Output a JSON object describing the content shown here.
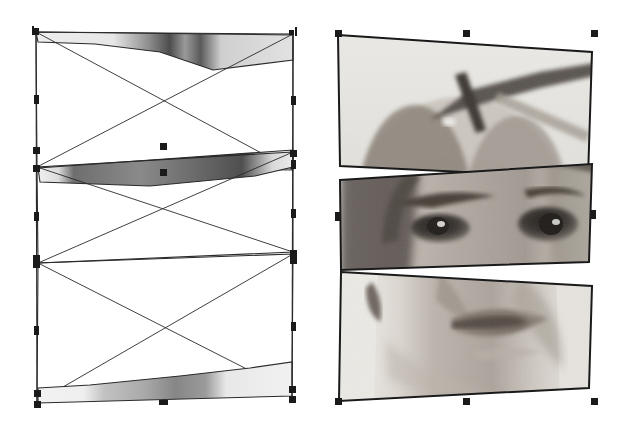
{
  "document": {
    "title": "Sliced portrait composition",
    "canvas_width": 629,
    "canvas_height": 435,
    "background_color": "#ffffff",
    "view_mode_left": "wireframe",
    "view_mode_right": "preview"
  },
  "panels": [
    {
      "id": "wireframe-panel",
      "label": "Wireframe view",
      "x": 0,
      "y": 0,
      "width": 314,
      "height": 435,
      "stroke_color": "#1a1a1a",
      "selection_handle_color": "#1a1a1a"
    },
    {
      "id": "preview-panel",
      "label": "Rendered preview",
      "x": 315,
      "y": 0,
      "width": 314,
      "height": 435,
      "stroke_color": "#1a1a1a",
      "selection_handle_color": "#1a1a1a"
    }
  ],
  "slices": [
    {
      "index": 0,
      "name": "slice-top-hat",
      "description": "Top band: hat brim and upper head",
      "bbox_wire": {
        "x": 35,
        "y": 31,
        "width": 258,
        "height": 140
      },
      "bbox_preview": {
        "x": 337,
        "y": 33,
        "width": 257,
        "height": 145
      },
      "quad_wire": [
        [
          35,
          31
        ],
        [
          293,
          33
        ],
        [
          293,
          171
        ],
        [
          37,
          169
        ]
      ],
      "quad_preview": [
        [
          338,
          35
        ],
        [
          592,
          52
        ],
        [
          588,
          178
        ],
        [
          340,
          166
        ]
      ],
      "skew_degrees": 3.8,
      "fill_tone": "#d8d8d8"
    },
    {
      "index": 1,
      "name": "slice-middle-eyes",
      "description": "Middle band: brow and eyes",
      "bbox_wire": {
        "x": 35,
        "y": 168,
        "width": 258,
        "height": 95
      },
      "bbox_preview": {
        "x": 337,
        "y": 170,
        "width": 257,
        "height": 95
      },
      "quad_wire": [
        [
          37,
          169
        ],
        [
          293,
          161
        ],
        [
          293,
          257
        ],
        [
          37,
          263
        ]
      ],
      "quad_preview": [
        [
          340,
          180
        ],
        [
          592,
          164
        ],
        [
          589,
          262
        ],
        [
          341,
          270
        ]
      ],
      "skew_degrees": -3.6,
      "fill_tone": "#9a9a9a"
    },
    {
      "index": 2,
      "name": "slice-bottom-mouth",
      "description": "Bottom band: nose, lips and chin",
      "bbox_wire": {
        "x": 35,
        "y": 256,
        "width": 258,
        "height": 148
      },
      "bbox_preview": {
        "x": 337,
        "y": 258,
        "width": 257,
        "height": 145
      },
      "quad_wire": [
        [
          37,
          263
        ],
        [
          293,
          257
        ],
        [
          293,
          396
        ],
        [
          35,
          404
        ]
      ],
      "quad_preview": [
        [
          341,
          272
        ],
        [
          592,
          286
        ],
        [
          589,
          388
        ],
        [
          339,
          401
        ]
      ],
      "skew_degrees": 3.2,
      "fill_tone": "#c4c4c4"
    }
  ],
  "wireframe_decorations": {
    "diagonal_cross": true,
    "diagonal_cross_count": 3,
    "bounding_box_outline": true,
    "sliver_fill": true,
    "description": "Each slice bounding box is drawn with an X diagonal cross; only a thin sliver of the bitmap is visible along each slice edge."
  },
  "handles": {
    "shape": "square",
    "size_px": 7,
    "color": "#1a1a1a",
    "wireframe_panel": [
      {
        "name": "handle-nw",
        "x": 35,
        "y": 31,
        "type": "sq"
      },
      {
        "name": "handle-n-tick-left",
        "x": 33,
        "y": 30,
        "type": "tick"
      },
      {
        "name": "handle-ne-tick",
        "x": 296,
        "y": 31,
        "type": "tick"
      },
      {
        "name": "handle-ne",
        "x": 291,
        "y": 32,
        "type": "sm"
      },
      {
        "name": "handle-w-mid-top",
        "x": 36,
        "y": 99,
        "type": "vt"
      },
      {
        "name": "handle-e-mid-top",
        "x": 293,
        "y": 100,
        "type": "vt"
      },
      {
        "name": "handle-w-slice0-bl",
        "x": 36,
        "y": 150,
        "type": "sq"
      },
      {
        "name": "handle-w-slice1-tl",
        "x": 36,
        "y": 168,
        "type": "sq"
      },
      {
        "name": "handle-e-slice0-br",
        "x": 293,
        "y": 153,
        "type": "sq"
      },
      {
        "name": "handle-e-slice1-tr",
        "x": 293,
        "y": 164,
        "type": "vt"
      },
      {
        "name": "handle-n-slice1-mid",
        "x": 163,
        "y": 146,
        "type": "sq"
      },
      {
        "name": "handle-s-slice1-mid",
        "x": 163,
        "y": 172,
        "type": "sq"
      },
      {
        "name": "handle-w-mid-bottom",
        "x": 36,
        "y": 216,
        "type": "vt"
      },
      {
        "name": "handle-e-mid-bottom",
        "x": 293,
        "y": 213,
        "type": "vt"
      },
      {
        "name": "handle-w-slice1-bl",
        "x": 36,
        "y": 258,
        "type": "sq"
      },
      {
        "name": "handle-e-slice1-br",
        "x": 293,
        "y": 253,
        "type": "sq"
      },
      {
        "name": "handle-w-slice2-tl",
        "x": 36,
        "y": 264,
        "type": "sq"
      },
      {
        "name": "handle-e-slice2-tr",
        "x": 293,
        "y": 260,
        "type": "sq"
      },
      {
        "name": "handle-w-lower",
        "x": 36,
        "y": 330,
        "type": "vt"
      },
      {
        "name": "handle-e-lower",
        "x": 293,
        "y": 326,
        "type": "vt"
      },
      {
        "name": "handle-sw",
        "x": 37,
        "y": 393,
        "type": "sq"
      },
      {
        "name": "handle-sw-outer",
        "x": 37,
        "y": 404,
        "type": "sq"
      },
      {
        "name": "handle-se",
        "x": 292,
        "y": 389,
        "type": "sq"
      },
      {
        "name": "handle-se-outer",
        "x": 292,
        "y": 399,
        "type": "sq"
      },
      {
        "name": "handle-s-mid",
        "x": 163,
        "y": 402,
        "type": "hz"
      }
    ],
    "preview_panel": [
      {
        "name": "handle-nw",
        "x": 338,
        "y": 33,
        "type": "sq"
      },
      {
        "name": "handle-n-mid",
        "x": 466,
        "y": 33,
        "type": "sq"
      },
      {
        "name": "handle-ne",
        "x": 594,
        "y": 33,
        "type": "sq"
      },
      {
        "name": "handle-w-mid",
        "x": 337,
        "y": 216,
        "type": "vt"
      },
      {
        "name": "handle-e-mid",
        "x": 593,
        "y": 214,
        "type": "vt"
      },
      {
        "name": "handle-sw",
        "x": 338,
        "y": 401,
        "type": "sq"
      },
      {
        "name": "handle-s-mid",
        "x": 466,
        "y": 401,
        "type": "sq"
      },
      {
        "name": "handle-se",
        "x": 594,
        "y": 401,
        "type": "sq"
      }
    ]
  },
  "photo": {
    "subject": "portrait of a woman wearing a hat",
    "style": "black and white halftone photograph",
    "tones": {
      "background": "#e6e4e0",
      "skin_light": "#cfc9c2",
      "skin_mid": "#a59d95",
      "skin_shadow": "#6f675f",
      "hat_light": "#9a9289",
      "hat_dark": "#5d554d",
      "hair_dark": "#4a443e",
      "eye_dark": "#2a2622",
      "lips": "#7a6c64",
      "darkest": "#1f1c19"
    }
  }
}
